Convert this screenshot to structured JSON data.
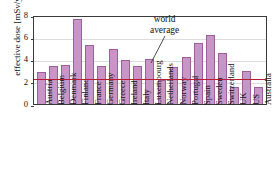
{
  "chart_data": {
    "type": "bar",
    "title": "",
    "xlabel": "",
    "ylabel": "effective dose [mSv/y]",
    "ylim": [
      0,
      8
    ],
    "yticks": [
      0,
      2,
      4,
      6,
      8
    ],
    "grid": true,
    "legend": "none",
    "categories": [
      "Austria",
      "Belgium",
      "Denmark",
      "Finland",
      "France",
      "Germany",
      "Greece",
      "Ireland",
      "Italy",
      "Luxembourg",
      "Netherlands",
      "Norway",
      "Portugal",
      "Spain",
      "Sweden",
      "Switzerland",
      "UK",
      "US",
      "Australia"
    ],
    "values": [
      2.8,
      3.4,
      3.5,
      7.6,
      5.3,
      3.4,
      4.9,
      3.9,
      3.4,
      4.0,
      2.1,
      3.3,
      4.2,
      5.4,
      6.2,
      4.5,
      1.5,
      2.9,
      1.5
    ],
    "annotations": [
      {
        "name": "world-average",
        "text_line1": "world",
        "text_line2": "average",
        "value": 2.4,
        "color": "#b51e34"
      }
    ],
    "colors": {
      "bar_fill": "#c796c6",
      "bar_stroke": "#9c5f9c",
      "average_line": "#b51e34",
      "grid": "#dcdcdc",
      "axis": "#3a3a3a"
    }
  }
}
